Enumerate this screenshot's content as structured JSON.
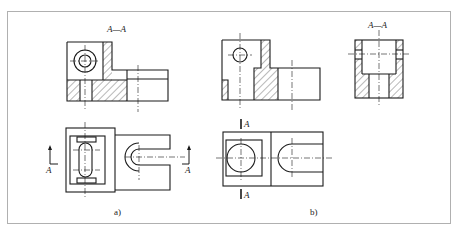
{
  "figure": {
    "frame_color": "#b0b0b0",
    "line_color": "#1a1a1a",
    "panels": [
      {
        "id": "a",
        "caption": "a)",
        "section_title": "A—A",
        "section_marker_left": "A",
        "section_marker_right": "A"
      },
      {
        "id": "b",
        "caption": "b)",
        "section_title": "A—A",
        "section_marker_top": "A",
        "section_marker_bottom": "A"
      }
    ]
  }
}
